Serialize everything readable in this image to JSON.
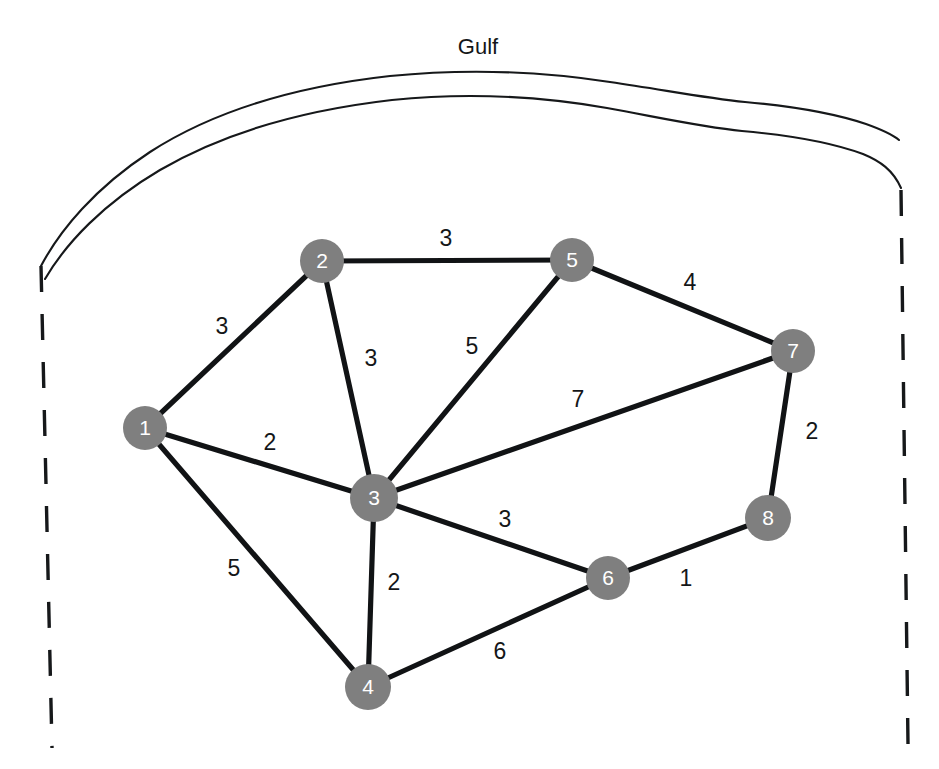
{
  "figure": {
    "title": "Gulf",
    "title_x": 478,
    "title_y": 48,
    "width": 939,
    "height": 769,
    "background_color": "#ffffff"
  },
  "style": {
    "node_fill": "#7f7f7f",
    "node_label_color": "#ffffff",
    "edge_color": "#111315",
    "weight_label_color": "#141618",
    "coastline_color": "#16181a",
    "border_color": "#16181a"
  },
  "geography": {
    "coastline_outer_path": "M 41,266 C 60,230 95,188 150,152 C 215,110 300,86 390,76 C 470,68 545,72 610,82 C 665,90 705,98 745,102 C 790,106 830,112 866,124 C 880,129 892,134 899,140",
    "coastline_inner_path": "M 45,279 C 66,243 104,203 160,170 C 225,132 305,110 392,100 C 470,92 544,97 607,108 C 662,118 702,127 742,131 C 788,135 828,141 863,154 C 880,161 893,170 901,188",
    "left_border_path": "M 41,266 L 52,748",
    "right_border_path": "M 901,190 L 908,744",
    "border_label": "state-boundary-dashed"
  },
  "graph": {
    "node_radius": 22,
    "nodes": [
      {
        "id": "1",
        "label": "1",
        "x": 145,
        "y": 428,
        "r": 22
      },
      {
        "id": "2",
        "label": "2",
        "x": 322,
        "y": 261,
        "r": 22
      },
      {
        "id": "3",
        "label": "3",
        "x": 374,
        "y": 498,
        "r": 24
      },
      {
        "id": "4",
        "label": "4",
        "x": 368,
        "y": 687,
        "r": 23
      },
      {
        "id": "5",
        "label": "5",
        "x": 572,
        "y": 260,
        "r": 22
      },
      {
        "id": "6",
        "label": "6",
        "x": 608,
        "y": 578,
        "r": 22
      },
      {
        "id": "7",
        "label": "7",
        "x": 793,
        "y": 351,
        "r": 22
      },
      {
        "id": "8",
        "label": "8",
        "x": 768,
        "y": 518,
        "r": 23
      }
    ],
    "edges": [
      {
        "id": "e-1-2",
        "from": "1",
        "to": "2",
        "weight": "3",
        "x1": 145,
        "y1": 428,
        "x2": 322,
        "y2": 261,
        "lx": 222,
        "ly": 328
      },
      {
        "id": "e-1-3",
        "from": "1",
        "to": "3",
        "weight": "2",
        "x1": 145,
        "y1": 428,
        "x2": 374,
        "y2": 498,
        "lx": 270,
        "ly": 444
      },
      {
        "id": "e-1-4",
        "from": "1",
        "to": "4",
        "weight": "5",
        "x1": 145,
        "y1": 428,
        "x2": 368,
        "y2": 687,
        "lx": 234,
        "ly": 570
      },
      {
        "id": "e-2-3",
        "from": "2",
        "to": "3",
        "weight": "3",
        "x1": 322,
        "y1": 261,
        "x2": 374,
        "y2": 498,
        "lx": 371,
        "ly": 360
      },
      {
        "id": "e-2-5",
        "from": "2",
        "to": "5",
        "weight": "3",
        "x1": 322,
        "y1": 261,
        "x2": 572,
        "y2": 260,
        "lx": 446,
        "ly": 240
      },
      {
        "id": "e-3-5",
        "from": "3",
        "to": "5",
        "weight": "5",
        "x1": 374,
        "y1": 498,
        "x2": 572,
        "y2": 260,
        "lx": 472,
        "ly": 348
      },
      {
        "id": "e-3-7",
        "from": "3",
        "to": "7",
        "weight": "7",
        "x1": 374,
        "y1": 498,
        "x2": 793,
        "y2": 351,
        "lx": 578,
        "ly": 401
      },
      {
        "id": "e-3-6",
        "from": "3",
        "to": "6",
        "weight": "3",
        "x1": 374,
        "y1": 498,
        "x2": 608,
        "y2": 578,
        "lx": 505,
        "ly": 521
      },
      {
        "id": "e-3-4",
        "from": "3",
        "to": "4",
        "weight": "2",
        "x1": 374,
        "y1": 498,
        "x2": 368,
        "y2": 687,
        "lx": 394,
        "ly": 584
      },
      {
        "id": "e-4-6",
        "from": "4",
        "to": "6",
        "weight": "6",
        "x1": 368,
        "y1": 687,
        "x2": 608,
        "y2": 578,
        "lx": 500,
        "ly": 653
      },
      {
        "id": "e-5-7",
        "from": "5",
        "to": "7",
        "weight": "4",
        "x1": 572,
        "y1": 260,
        "x2": 793,
        "y2": 351,
        "lx": 690,
        "ly": 284
      },
      {
        "id": "e-6-8",
        "from": "6",
        "to": "8",
        "weight": "1",
        "x1": 608,
        "y1": 578,
        "x2": 768,
        "y2": 518,
        "lx": 686,
        "ly": 580
      },
      {
        "id": "e-7-8",
        "from": "7",
        "to": "8",
        "weight": "2",
        "x1": 793,
        "y1": 351,
        "x2": 768,
        "y2": 518,
        "lx": 812,
        "ly": 433
      }
    ]
  }
}
